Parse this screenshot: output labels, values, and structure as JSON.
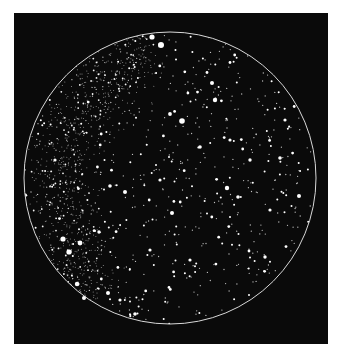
{
  "figure": {
    "background_color": "#0a0a0a",
    "page_color": "#ffffff",
    "star_color": "#ffffff",
    "frame": {
      "x": 14,
      "y": 13,
      "width": 314,
      "height": 331
    },
    "circle": {
      "cx": 170,
      "cy": 178,
      "r": 146,
      "stroke": "#d8d8d8",
      "stroke_width": 1
    },
    "milky_way": {
      "description": "dense band of faint stars running from upper centre down through the left side",
      "path": [
        [
          150,
          40
        ],
        [
          110,
          70
        ],
        [
          80,
          110
        ],
        [
          62,
          160
        ],
        [
          62,
          210
        ],
        [
          75,
          260
        ],
        [
          95,
          300
        ]
      ],
      "width": 45,
      "count": 900
    },
    "field_star_count": 650,
    "bright_stars": [
      {
        "x": 152,
        "y": 37,
        "r": 2.6
      },
      {
        "x": 161,
        "y": 45,
        "r": 3.0
      },
      {
        "x": 182,
        "y": 121,
        "r": 2.8
      },
      {
        "x": 170,
        "y": 114,
        "r": 1.9
      },
      {
        "x": 63,
        "y": 239,
        "r": 2.6
      },
      {
        "x": 80,
        "y": 243,
        "r": 2.4
      },
      {
        "x": 69,
        "y": 252,
        "r": 2.6
      },
      {
        "x": 77,
        "y": 284,
        "r": 2.2
      },
      {
        "x": 78,
        "y": 284,
        "r": 1.5
      },
      {
        "x": 84,
        "y": 298,
        "r": 2.0
      },
      {
        "x": 108,
        "y": 293,
        "r": 2.0
      },
      {
        "x": 172,
        "y": 213,
        "r": 2.0
      },
      {
        "x": 227,
        "y": 188,
        "r": 2.2
      },
      {
        "x": 215,
        "y": 100,
        "r": 2.2
      },
      {
        "x": 212,
        "y": 83,
        "r": 2.0
      },
      {
        "x": 299,
        "y": 196,
        "r": 2.0
      },
      {
        "x": 135,
        "y": 314,
        "r": 1.8
      },
      {
        "x": 125,
        "y": 192,
        "r": 2.0
      },
      {
        "x": 110,
        "y": 186,
        "r": 1.8
      },
      {
        "x": 280,
        "y": 158,
        "r": 1.8
      },
      {
        "x": 238,
        "y": 197,
        "r": 1.8
      },
      {
        "x": 200,
        "y": 147,
        "r": 1.8
      },
      {
        "x": 55,
        "y": 160,
        "r": 1.6
      },
      {
        "x": 120,
        "y": 300,
        "r": 1.6
      },
      {
        "x": 265,
        "y": 257,
        "r": 1.7
      },
      {
        "x": 285,
        "y": 120,
        "r": 1.6
      },
      {
        "x": 250,
        "y": 160,
        "r": 1.7
      },
      {
        "x": 230,
        "y": 140,
        "r": 1.6
      },
      {
        "x": 190,
        "y": 260,
        "r": 1.6
      },
      {
        "x": 150,
        "y": 250,
        "r": 1.6
      },
      {
        "x": 270,
        "y": 210,
        "r": 1.6
      },
      {
        "x": 160,
        "y": 180,
        "r": 1.6
      },
      {
        "x": 99,
        "y": 232,
        "r": 1.7
      }
    ]
  }
}
